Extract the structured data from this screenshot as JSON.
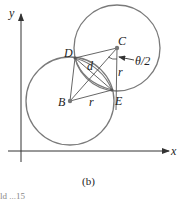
{
  "figure": {
    "caption": "(b)",
    "footer_fragment": "ld ...15"
  },
  "axes": {
    "x_label": "x",
    "y_label": "y"
  },
  "points": {
    "B": "B",
    "C": "C",
    "D": "D",
    "E": "E"
  },
  "annotations": {
    "d": "d",
    "r_vertical": "r",
    "r_horizontal": "r",
    "angle": "θ/2"
  },
  "colors": {
    "circle": "#7a7a7a",
    "line": "#555555",
    "axis": "#333333",
    "point": "#777777"
  }
}
